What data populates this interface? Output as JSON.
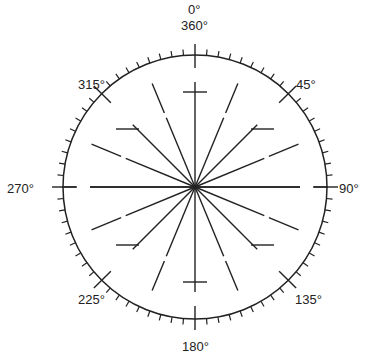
{
  "diagram": {
    "type": "compass-rose",
    "center": [
      195,
      187
    ],
    "radius": 132,
    "ink_color": "#222222",
    "minor_tick_step_deg": 5,
    "major_ticks_deg": [
      0,
      45,
      90,
      135,
      180,
      225,
      270,
      315
    ],
    "ray_step_deg": 22.5,
    "labels": {
      "north_top": "0°",
      "north": "360°",
      "ne": "45°",
      "east": "90°",
      "se": "135°",
      "south": "180°",
      "sw": "225°",
      "west": "270°",
      "nw": "315°"
    }
  }
}
